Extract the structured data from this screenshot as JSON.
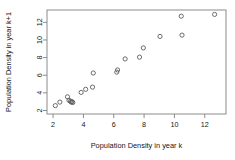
{
  "chart_data": {
    "type": "scatter",
    "title": "",
    "xlabel": "Population Density in year k",
    "ylabel": "Population Density in year k+1",
    "xlim": [
      1.6,
      13.4
    ],
    "ylim": [
      1.6,
      13.4
    ],
    "xticks": [
      2,
      4,
      6,
      8,
      10,
      12
    ],
    "yticks": [
      2,
      4,
      6,
      8,
      10,
      12
    ],
    "grid": false,
    "legend": null,
    "marker": "open-circle",
    "marker_color": "#5c5c5c",
    "frame_color": "#8b8b8b",
    "points": [
      {
        "x": 2.15,
        "y": 2.55
      },
      {
        "x": 2.45,
        "y": 2.95
      },
      {
        "x": 2.95,
        "y": 3.55
      },
      {
        "x": 3.05,
        "y": 3.15
      },
      {
        "x": 3.15,
        "y": 3.05
      },
      {
        "x": 3.2,
        "y": 2.95
      },
      {
        "x": 3.25,
        "y": 3.0
      },
      {
        "x": 3.3,
        "y": 2.9
      },
      {
        "x": 3.85,
        "y": 4.05
      },
      {
        "x": 4.15,
        "y": 4.4
      },
      {
        "x": 4.6,
        "y": 4.65
      },
      {
        "x": 4.65,
        "y": 6.25
      },
      {
        "x": 6.2,
        "y": 6.35
      },
      {
        "x": 6.25,
        "y": 6.6
      },
      {
        "x": 6.75,
        "y": 7.85
      },
      {
        "x": 7.7,
        "y": 8.05
      },
      {
        "x": 7.95,
        "y": 9.1
      },
      {
        "x": 9.05,
        "y": 10.4
      },
      {
        "x": 10.5,
        "y": 10.55
      },
      {
        "x": 10.45,
        "y": 12.7
      },
      {
        "x": 12.65,
        "y": 12.9
      }
    ]
  }
}
